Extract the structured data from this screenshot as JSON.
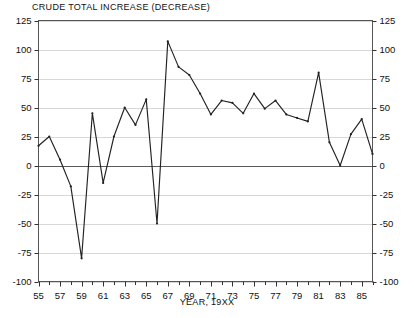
{
  "chart_data": {
    "type": "line",
    "title": "CRUDE TOTAL INCREASE (DECREASE)",
    "xlabel": "YEAR, 19XX",
    "ylabel": "",
    "xlim": [
      55,
      86
    ],
    "ylim": [
      -100,
      125
    ],
    "grid": true,
    "legend": "none",
    "yticks": [
      125,
      100,
      75,
      50,
      25,
      0,
      -25,
      -50,
      -75,
      -100
    ],
    "ytick_labels_left": [
      "125",
      "100",
      "75",
      "50",
      "25",
      "0",
      "-25",
      "-50",
      "-75",
      "-100"
    ],
    "ytick_labels_right": [
      "125",
      "100",
      "75",
      "50",
      "25",
      "0",
      "-25",
      "-50",
      "-75",
      "-100"
    ],
    "xticks": [
      55,
      56,
      57,
      58,
      59,
      60,
      61,
      62,
      63,
      64,
      65,
      66,
      67,
      68,
      69,
      70,
      71,
      72,
      73,
      74,
      75,
      76,
      77,
      78,
      79,
      80,
      81,
      82,
      83,
      84,
      85,
      86
    ],
    "xtick_labels": [
      "55",
      "57",
      "59",
      "61",
      "63",
      "65",
      "67",
      "69",
      "71",
      "73",
      "75",
      "77",
      "79",
      "81",
      "83",
      "85"
    ],
    "xtick_label_years": [
      55,
      57,
      59,
      61,
      63,
      65,
      67,
      69,
      71,
      73,
      75,
      77,
      79,
      81,
      83,
      85
    ],
    "series": [
      {
        "name": "Crude total increase (decrease)",
        "color": "#222222",
        "x": [
          55,
          56,
          57,
          58,
          59,
          60,
          61,
          62,
          63,
          64,
          65,
          66,
          67,
          68,
          69,
          70,
          71,
          72,
          73,
          74,
          75,
          76,
          77,
          78,
          79,
          80,
          81,
          82,
          83,
          84,
          85,
          86
        ],
        "values": [
          17,
          25,
          5,
          -18,
          -80,
          45,
          -15,
          25,
          50,
          35,
          57,
          -50,
          107,
          85,
          78,
          62,
          44,
          56,
          54,
          45,
          62,
          49,
          56,
          44,
          41,
          38,
          80,
          20,
          0,
          27,
          40,
          10
        ]
      }
    ]
  },
  "axes": {
    "left_labels": [
      "125",
      "100",
      "75",
      "50",
      "25",
      "0",
      "-25",
      "-50",
      "-75",
      "-100"
    ],
    "right_labels": [
      "125",
      "100",
      "75",
      "50",
      "25",
      "0",
      "-25",
      "-50",
      "-75",
      "-100"
    ]
  }
}
